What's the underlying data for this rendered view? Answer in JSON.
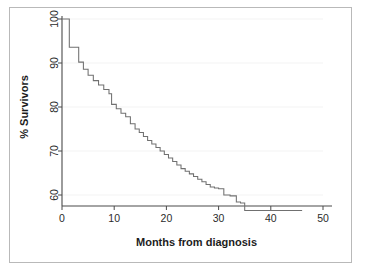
{
  "figure": {
    "has_border": true,
    "border_color": "#b9b9b9",
    "background": "#ffffff"
  },
  "chart_data": {
    "type": "line",
    "subtype": "kaplan-meier-step",
    "title": "",
    "subtitle": "",
    "xlabel": "Months from diagnosis",
    "ylabel": "% Survivors",
    "xlim": [
      0,
      50
    ],
    "ylim": [
      55,
      101
    ],
    "xticks": [
      0,
      10,
      20,
      30,
      40,
      50
    ],
    "xtick_labels": [
      "0",
      "10",
      "20",
      "30",
      "40",
      "50"
    ],
    "yticks": [
      60,
      70,
      80,
      90,
      100
    ],
    "ytick_labels": [
      "60",
      "70",
      "80",
      "90",
      "100"
    ],
    "grid": "faint-horizontal-major",
    "legend": "none",
    "annotations": [],
    "line_color": "#707070",
    "axis_color": "#4a4a4a",
    "series": [
      {
        "name": "Survival",
        "step": "post",
        "x": [
          0,
          1,
          1.4,
          2.6,
          3.2,
          4.1,
          5.0,
          6.0,
          7.0,
          8.0,
          9.0,
          9.5,
          10.4,
          11.3,
          12.2,
          13.1,
          14.0,
          14.8,
          15.6,
          16.4,
          17.2,
          18.0,
          18.8,
          19.6,
          20.4,
          21.2,
          22.0,
          22.8,
          23.6,
          24.4,
          25.2,
          26.0,
          26.8,
          27.6,
          28.4,
          29.2,
          30.0,
          31.0,
          32.2,
          33.4,
          34.2,
          35.0,
          46.0
        ],
        "y": [
          100.0,
          100.0,
          93.6,
          93.6,
          90.2,
          88.6,
          87.2,
          86.0,
          85.0,
          84.0,
          83.0,
          80.6,
          79.6,
          78.6,
          77.8,
          76.2,
          75.0,
          74.2,
          73.3,
          72.4,
          71.6,
          70.8,
          70.0,
          69.2,
          68.4,
          67.6,
          66.8,
          66.0,
          65.4,
          64.8,
          64.2,
          63.6,
          63.0,
          62.4,
          61.8,
          61.6,
          61.4,
          60.0,
          59.8,
          58.4,
          58.2,
          56.5,
          56.5
        ]
      }
    ]
  }
}
